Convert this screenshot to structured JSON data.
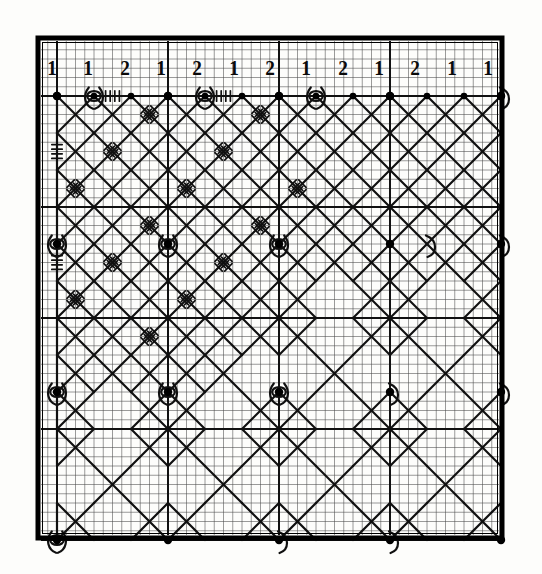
{
  "figure": {
    "kind": "monolinear mirror curve on dot lattice",
    "background_color": "#fdfdfb",
    "ink_color": "#101010",
    "border_color": "#000000"
  },
  "column_labels": {
    "name": "top-row-multiplicity-labels",
    "values": [
      "1",
      "1",
      "2",
      "1",
      "2",
      "1",
      "2",
      "1",
      "2",
      "1",
      "2",
      "1",
      "1"
    ]
  },
  "lattice": {
    "columns": 13,
    "rows": 13,
    "dot_spacing_px": 37,
    "origin_x": 57,
    "origin_y": 96,
    "fine_grid_subdivisions": 4,
    "fine_grid_color": "#4a4a4a",
    "major_grid_color": "#111111",
    "major_grid_columns": [
      0,
      3,
      6,
      9,
      12
    ],
    "major_grid_rows": [
      0,
      3,
      6,
      9,
      12
    ],
    "dot_radius_px": 4.2,
    "dot_color": "#000000"
  },
  "border": {
    "x": 38,
    "y": 38,
    "width": 464,
    "height": 500,
    "stroke_width": 5
  },
  "decoration": {
    "hatch_mark_label": "comb-tick decoration",
    "loop_label": "eye-loop around lattice dot",
    "hook_label": "half-hook around lattice dot",
    "decorated_region": "upper-left quadrant",
    "plain_region": "lower-right quadrant"
  },
  "chart_data": {
    "type": "diagram",
    "categories": [
      "1",
      "1",
      "2",
      "1",
      "2",
      "1",
      "2",
      "1",
      "2",
      "1",
      "2",
      "1",
      "1"
    ],
    "values": [
      1,
      1,
      2,
      1,
      2,
      1,
      2,
      1,
      2,
      1,
      2,
      1,
      1
    ],
    "xlabel": "",
    "ylabel": ""
  }
}
